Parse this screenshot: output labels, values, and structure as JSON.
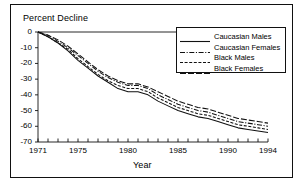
{
  "figure": {
    "name": "percent-decline-line-chart",
    "background_color": "#ffffff",
    "line_color": "#111111",
    "frame_color": "#111111"
  },
  "axis": {
    "y_title": "Percent Decline",
    "x_title": "Year"
  },
  "legend": {
    "entries": [
      {
        "label": "Caucasian Males",
        "style": "solid"
      },
      {
        "label": "Caucasian Females",
        "style": "dash-dot"
      },
      {
        "label": "Black Males",
        "style": "dashed-short"
      },
      {
        "label": "Black Females",
        "style": "dashed-long"
      }
    ]
  },
  "chart_data": {
    "type": "line",
    "title": "",
    "subtitle": "",
    "xlabel": "Year",
    "ylabel": "Percent Decline",
    "xlim": [
      1971,
      1994
    ],
    "ylim": [
      -70,
      0
    ],
    "grid": false,
    "legend_position": "top-right",
    "x_ticks_all": [
      1971,
      1972,
      1973,
      1974,
      1975,
      1976,
      1977,
      1978,
      1979,
      1980,
      1981,
      1982,
      1983,
      1984,
      1985,
      1986,
      1987,
      1988,
      1989,
      1990,
      1991,
      1992,
      1993,
      1994
    ],
    "x_tick_labels": [
      "1971",
      "1975",
      "1980",
      "1985",
      "1990",
      "1994"
    ],
    "x_tick_label_values": [
      1971,
      1975,
      1980,
      1985,
      1990,
      1994
    ],
    "y_ticks": [
      0,
      -10,
      -20,
      -30,
      -40,
      -50,
      -60,
      -70
    ],
    "y_tick_labels": [
      "0",
      "-10",
      "-20",
      "-30",
      "-40",
      "-50",
      "-60",
      "-70"
    ],
    "x": [
      1971,
      1972,
      1973,
      1974,
      1975,
      1976,
      1977,
      1978,
      1979,
      1980,
      1981,
      1982,
      1983,
      1984,
      1985,
      1986,
      1987,
      1988,
      1989,
      1990,
      1991,
      1992,
      1993,
      1994
    ],
    "series": [
      {
        "name": "Caucasian Males",
        "style": "solid",
        "values": [
          0,
          -3,
          -7,
          -12,
          -18,
          -23,
          -28,
          -32,
          -36,
          -38,
          -38,
          -40,
          -44,
          -47,
          -50,
          -52,
          -54,
          -55,
          -57,
          -59,
          -61,
          -62,
          -63,
          -64
        ]
      },
      {
        "name": "Caucasian Females",
        "style": "dash-dot",
        "values": [
          0,
          -2,
          -6,
          -10,
          -15,
          -20,
          -25,
          -29,
          -32,
          -34,
          -34,
          -36,
          -40,
          -43,
          -46,
          -48,
          -50,
          -51,
          -53,
          -55,
          -57,
          -58,
          -59,
          -60
        ]
      },
      {
        "name": "Black Males",
        "style": "dashed-short",
        "values": [
          0,
          -3,
          -7,
          -11,
          -17,
          -22,
          -27,
          -31,
          -34,
          -36,
          -36,
          -38,
          -42,
          -45,
          -48,
          -50,
          -52,
          -53,
          -55,
          -57,
          -59,
          -60,
          -61,
          -62
        ]
      },
      {
        "name": "Black Females",
        "style": "dashed-long",
        "values": [
          0,
          -2,
          -5,
          -9,
          -14,
          -19,
          -24,
          -28,
          -31,
          -33,
          -33,
          -35,
          -38,
          -41,
          -44,
          -46,
          -48,
          -49,
          -51,
          -53,
          -55,
          -56,
          -57,
          -58
        ]
      }
    ]
  }
}
